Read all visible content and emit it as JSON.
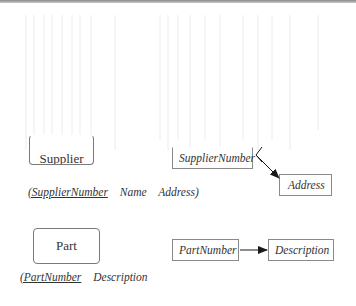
{
  "diagram": {
    "entities": [
      {
        "id": "supplier",
        "label": "Supplier"
      },
      {
        "id": "part",
        "label": "Part"
      }
    ],
    "relations": {
      "supplier": {
        "open_paren_key": "(SupplierNumber",
        "attributes": [
          "Name",
          "Address)"
        ]
      },
      "part": {
        "open_paren_key": "(PartNumber",
        "attributes": [
          "Description"
        ]
      }
    },
    "dependencies": [
      {
        "from": "SupplierNumber",
        "to": "Address"
      },
      {
        "from": "PartNumber",
        "to": "Description"
      }
    ],
    "colors": {
      "line": "#1a1a1a",
      "box_border": "#8a8a8a",
      "top_rule": "#8a8a8a"
    }
  }
}
